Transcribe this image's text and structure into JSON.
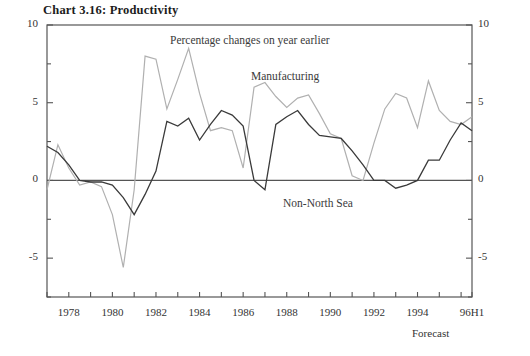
{
  "title": "Chart 3.16: Productivity",
  "annotations": {
    "subtitle": "Percentage changes on year earlier",
    "manufacturing": "Manufacturing",
    "non_north_sea": "Non-North Sea",
    "forecast": "Forecast"
  },
  "axis": {
    "y_ticks_left": [
      "10",
      "5",
      "0",
      "-5"
    ],
    "y_ticks_right": [
      "10",
      "5",
      "0",
      "-5"
    ],
    "x_ticks": [
      "1978",
      "1980",
      "1982",
      "1984",
      "1986",
      "1988",
      "1990",
      "1992",
      "1994",
      "96H1"
    ]
  },
  "colors": {
    "manufacturing": "#b0b0b0",
    "non_north_sea": "#3a3a3a",
    "axis": "#555555",
    "zero_line": "#555555",
    "text": "#2a2a2a"
  },
  "chart_data": {
    "type": "line",
    "title": "Chart 3.16: Productivity",
    "subtitle": "Percentage changes on year earlier",
    "xlabel": "",
    "ylabel": "",
    "ylim": [
      -7.5,
      10
    ],
    "xlim": [
      1977,
      1996.5
    ],
    "grid": false,
    "legend_position": "inline-annotation",
    "y_ticks": [
      -5,
      0,
      5,
      10
    ],
    "x_tick_values": [
      1978,
      1980,
      1982,
      1984,
      1986,
      1988,
      1990,
      1992,
      1994,
      1996.5
    ],
    "x_tick_labels": [
      "1978",
      "1980",
      "1982",
      "1984",
      "1986",
      "1988",
      "1990",
      "1992",
      "1994",
      "96H1"
    ],
    "x": [
      1977,
      1977.5,
      1978,
      1978.5,
      1979,
      1979.5,
      1980,
      1980.5,
      1981,
      1981.5,
      1982,
      1982.5,
      1983,
      1983.5,
      1984,
      1984.5,
      1985,
      1985.5,
      1986,
      1986.5,
      1987,
      1987.5,
      1988,
      1988.5,
      1989,
      1989.5,
      1990,
      1990.5,
      1991,
      1991.5,
      1992,
      1992.5,
      1993,
      1993.5,
      1994,
      1994.5,
      1995,
      1995.5,
      1996,
      1996.5
    ],
    "series": [
      {
        "name": "Manufacturing",
        "color": "#b0b0b0",
        "values": [
          -0.6,
          2.3,
          0.8,
          -0.3,
          -0.1,
          -0.4,
          -2.2,
          -5.6,
          -0.6,
          8.0,
          7.8,
          4.6,
          6.5,
          8.5,
          5.6,
          3.2,
          3.4,
          3.2,
          0.8,
          6.0,
          6.3,
          5.4,
          4.7,
          5.3,
          5.5,
          4.3,
          3.0,
          2.7,
          0.3,
          0.0,
          2.4,
          4.6,
          5.6,
          5.3,
          3.4,
          6.4,
          4.5,
          3.8,
          3.6,
          4.1
        ]
      },
      {
        "name": "Non-North Sea",
        "color": "#3a3a3a",
        "values": [
          2.2,
          1.8,
          1.0,
          0.0,
          -0.1,
          -0.1,
          -0.3,
          -1.1,
          -2.2,
          -0.9,
          0.6,
          3.8,
          3.5,
          4.0,
          2.6,
          3.6,
          4.5,
          4.2,
          3.5,
          0.0,
          -0.6,
          3.6,
          4.1,
          4.5,
          3.6,
          2.9,
          2.8,
          2.7,
          1.9,
          1.0,
          0.0,
          0.0,
          -0.5,
          -0.3,
          0.0,
          1.3,
          1.3,
          2.6,
          3.7,
          3.2
        ]
      }
    ]
  }
}
